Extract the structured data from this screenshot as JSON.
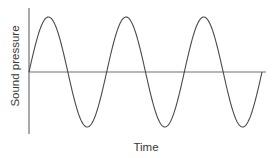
{
  "chart_data": {
    "type": "line",
    "title": "",
    "xlabel": "Time",
    "ylabel": "Sound pressure",
    "function": "sine",
    "cycles": 3,
    "amplitude": 1,
    "phase_start": "zero-crossing rising",
    "xlim": [
      0,
      3
    ],
    "ylim": [
      -1,
      1
    ],
    "grid": false,
    "legend": "none",
    "colors": {
      "wave": "#4a4a4a",
      "axis": "#6f6f6f"
    }
  }
}
